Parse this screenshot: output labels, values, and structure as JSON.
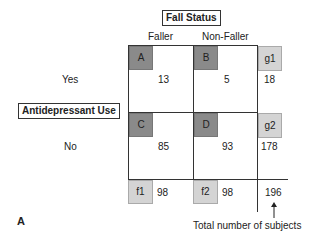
{
  "title": "Fall Status",
  "row_variable": "Antidepressant Use",
  "columns": [
    "Faller",
    "Non-Faller"
  ],
  "rows": [
    "Yes",
    "No"
  ],
  "cells": {
    "A": {
      "label": "A",
      "value": "13"
    },
    "B": {
      "label": "B",
      "value": "5"
    },
    "C": {
      "label": "C",
      "value": "85"
    },
    "D": {
      "label": "D",
      "value": "93"
    }
  },
  "row_totals": [
    {
      "label": "g1",
      "value": "18"
    },
    {
      "label": "g2",
      "value": "178"
    }
  ],
  "col_totals": [
    {
      "label": "f1",
      "value": "98"
    },
    {
      "label": "f2",
      "value": "98"
    }
  ],
  "grand_total": "196",
  "grand_total_caption": "Total number of subjects",
  "panel_label": "A"
}
